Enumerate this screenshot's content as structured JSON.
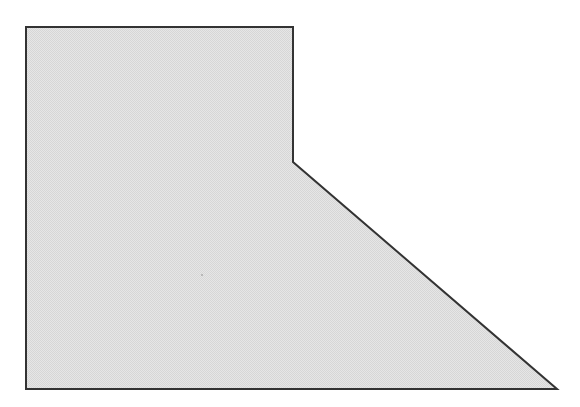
{
  "diagram": {
    "type": "polygon",
    "vertices": [
      [
        26,
        27
      ],
      [
        293,
        27
      ],
      [
        293,
        162
      ],
      [
        557,
        389
      ],
      [
        26,
        389
      ]
    ],
    "fill_color": "#e2e2e2",
    "stroke_color": "#333333",
    "stroke_width": 2
  },
  "header": {
    "cut_off_text": ""
  }
}
